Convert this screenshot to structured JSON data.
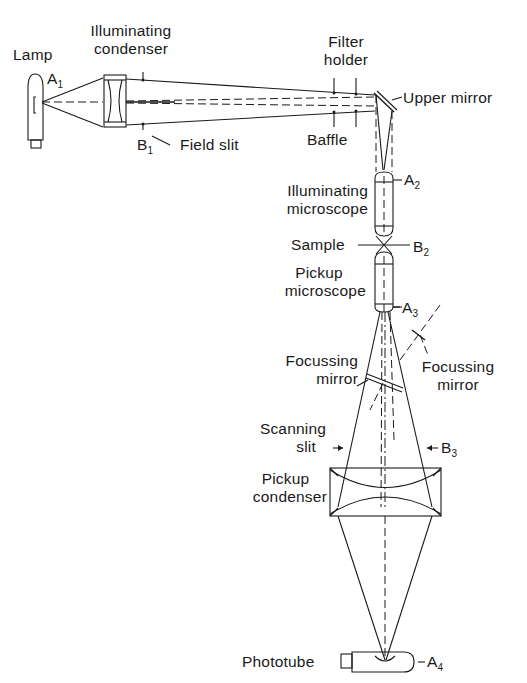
{
  "diagram": {
    "type": "optical-schematic",
    "components": {
      "lamp": {
        "label": "Lamp",
        "point": "A",
        "point_sub": "1"
      },
      "illuminating_condenser": {
        "line1": "Illuminating",
        "line2": "condenser"
      },
      "field_slit": {
        "label": "Field slit",
        "point": "B",
        "point_sub": "1"
      },
      "filter_holder": {
        "line1": "Filter",
        "line2": "holder"
      },
      "baffle": {
        "label": "Baffle"
      },
      "upper_mirror": {
        "label": "Upper mirror"
      },
      "illuminating_microscope": {
        "line1": "Illuminating",
        "line2": "microscope",
        "point": "A",
        "point_sub": "2"
      },
      "sample": {
        "label": "Sample",
        "point": "B",
        "point_sub": "2"
      },
      "pickup_microscope": {
        "line1": "Pickup",
        "line2": "microscope",
        "point": "A",
        "point_sub": "3"
      },
      "focussing_mirror_left": {
        "line1": "Focussing",
        "line2": "mirror"
      },
      "focussing_mirror_right": {
        "line1": "Focussing",
        "line2": "mirror"
      },
      "scanning_slit": {
        "line1": "Scanning",
        "line2": "slit",
        "point": "B",
        "point_sub": "3"
      },
      "pickup_condenser": {
        "line1": "Pickup",
        "line2": "condenser"
      },
      "phototube": {
        "label": "Phototube",
        "point": "A",
        "point_sub": "4"
      }
    },
    "connections": [
      {
        "from": "lamp",
        "to": "illuminating_condenser"
      },
      {
        "from": "illuminating_condenser",
        "to": "filter_holder"
      },
      {
        "from": "filter_holder",
        "to": "upper_mirror"
      },
      {
        "from": "upper_mirror",
        "to": "illuminating_microscope"
      },
      {
        "from": "illuminating_microscope",
        "to": "sample"
      },
      {
        "from": "sample",
        "to": "pickup_microscope"
      },
      {
        "from": "pickup_microscope",
        "to": "focussing_mirror_left"
      },
      {
        "from": "focussing_mirror_left",
        "to": "scanning_slit"
      },
      {
        "from": "scanning_slit",
        "to": "pickup_condenser"
      },
      {
        "from": "pickup_condenser",
        "to": "phototube"
      }
    ]
  }
}
